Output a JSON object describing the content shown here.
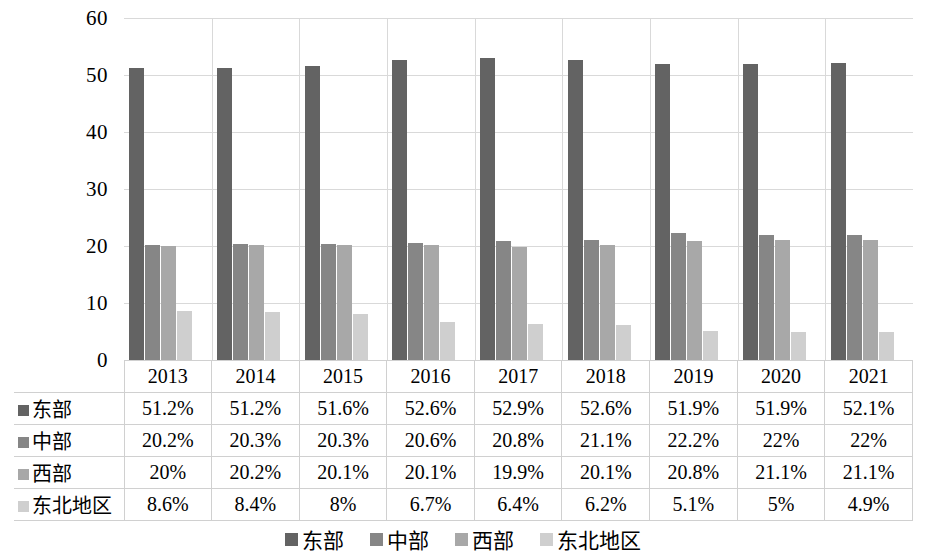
{
  "chart_data": {
    "type": "bar",
    "title": "",
    "subtitle": "",
    "xlabel": "",
    "ylabel": "",
    "ylim": [
      0,
      60
    ],
    "ytick_labels": [
      "60",
      "50",
      "40",
      "30",
      "20",
      "10",
      "0"
    ],
    "ytick_values": [
      60,
      50,
      40,
      30,
      20,
      10,
      0
    ],
    "grid": true,
    "legend_position": "bottom",
    "categories": [
      "2013",
      "2014",
      "2015",
      "2016",
      "2017",
      "2018",
      "2019",
      "2020",
      "2021"
    ],
    "series": [
      {
        "name": "东部",
        "color": "#636363",
        "values": [
          51.2,
          51.2,
          51.6,
          52.6,
          52.9,
          52.6,
          51.9,
          51.9,
          52.1
        ],
        "labels": [
          "51.2%",
          "51.2%",
          "51.6%",
          "52.6%",
          "52.9%",
          "52.6%",
          "51.9%",
          "51.9%",
          "52.1%"
        ]
      },
      {
        "name": "中部",
        "color": "#868686",
        "values": [
          20.2,
          20.3,
          20.3,
          20.6,
          20.8,
          21.1,
          22.2,
          22.0,
          22.0
        ],
        "labels": [
          "20.2%",
          "20.3%",
          "20.3%",
          "20.6%",
          "20.8%",
          "21.1%",
          "22.2%",
          "22%",
          "22%"
        ]
      },
      {
        "name": "西部",
        "color": "#a8a8a8",
        "values": [
          20.0,
          20.2,
          20.1,
          20.1,
          19.9,
          20.1,
          20.8,
          21.1,
          21.1
        ],
        "labels": [
          "20%",
          "20.2%",
          "20.1%",
          "20.1%",
          "19.9%",
          "20.1%",
          "20.8%",
          "21.1%",
          "21.1%"
        ]
      },
      {
        "name": "东北地区",
        "color": "#cfcfcf",
        "values": [
          8.6,
          8.4,
          8.0,
          6.7,
          6.4,
          6.2,
          5.1,
          5.0,
          4.9
        ],
        "labels": [
          "8.6%",
          "8.4%",
          "8%",
          "6.7%",
          "6.4%",
          "6.2%",
          "5.1%",
          "5%",
          "4.9%"
        ]
      }
    ]
  },
  "table": {
    "corner_label": "",
    "column_headers": [
      "2013",
      "2014",
      "2015",
      "2016",
      "2017",
      "2018",
      "2019",
      "2020",
      "2021"
    ],
    "rows": [
      {
        "label": "东部",
        "swatch": "s0",
        "cells": [
          "51.2%",
          "51.2%",
          "51.6%",
          "52.6%",
          "52.9%",
          "52.6%",
          "51.9%",
          "51.9%",
          "52.1%"
        ]
      },
      {
        "label": "中部",
        "swatch": "s1",
        "cells": [
          "20.2%",
          "20.3%",
          "20.3%",
          "20.6%",
          "20.8%",
          "21.1%",
          "22.2%",
          "22%",
          "22%"
        ]
      },
      {
        "label": "西部",
        "swatch": "s2",
        "cells": [
          "20%",
          "20.2%",
          "20.1%",
          "20.1%",
          "19.9%",
          "20.1%",
          "20.8%",
          "21.1%",
          "21.1%"
        ]
      },
      {
        "label": "东北地区",
        "swatch": "s3",
        "cells": [
          "8.6%",
          "8.4%",
          "8%",
          "6.7%",
          "6.4%",
          "6.2%",
          "5.1%",
          "5%",
          "4.9%"
        ]
      }
    ]
  },
  "legend": {
    "items": [
      {
        "label": "东部",
        "swatch": "s0"
      },
      {
        "label": "中部",
        "swatch": "s1"
      },
      {
        "label": "西部",
        "swatch": "s2"
      },
      {
        "label": "东北地区",
        "swatch": "s3"
      }
    ]
  }
}
